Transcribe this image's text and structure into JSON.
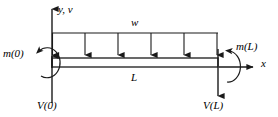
{
  "diagram": {
    "type": "engineering-free-body-diagram",
    "labels": {
      "axis_y": "y, v",
      "axis_x": "x",
      "distributed_load": "w",
      "beam_length": "L",
      "moment_left": "m(0)",
      "moment_right": "m(L)",
      "shear_left": "V(0)",
      "shear_right": "V(L)"
    },
    "colors": {
      "stroke": "#1a1a1a",
      "background": "#ffffff"
    },
    "geometry": {
      "beam_x_start": 52,
      "beam_x_end": 218,
      "beam_y_top": 58,
      "beam_y_bottom": 67,
      "load_line_y": 33,
      "load_arrow_count": 6,
      "load_arrow_x_positions": [
        52,
        85,
        118,
        151,
        184,
        217
      ],
      "axis_y_top": 5,
      "axis_x_end": 256,
      "shear_left_arrow_bottom": 103,
      "shear_right_arrow_bottom": 96
    }
  }
}
